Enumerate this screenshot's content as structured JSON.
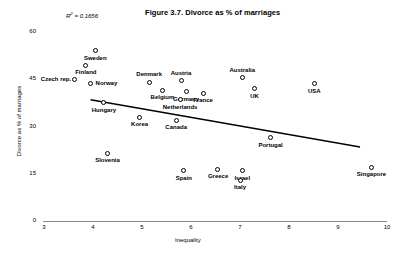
{
  "chart_data": {
    "type": "scatter",
    "title": "Figure 3.7. Divorce as % of marriages",
    "xlabel": "Inequality",
    "ylabel": "Divorce as % of marriages",
    "r2_prefix": "R",
    "r2_sup": "2",
    "r2_text": " = 0.1656",
    "r2_value": 0.1656,
    "xlim": [
      3,
      10
    ],
    "ylim": [
      0,
      60
    ],
    "xticks": [
      "3",
      "4",
      "5",
      "6",
      "7",
      "8",
      "9",
      "10"
    ],
    "yticks": [
      "60",
      "45",
      "30",
      "15",
      "0"
    ],
    "grid": false,
    "legend": "none",
    "marker_style": "open-circle",
    "trendline": {
      "visible": true,
      "x_start": 3.95,
      "y_start": 38.5,
      "x_end": 9.45,
      "y_end": 23.5,
      "slope": -2.73,
      "intercept": 49.3
    },
    "points": [
      {
        "label": "Sweden",
        "x": 4.05,
        "y": 54.0,
        "label_pos": "below"
      },
      {
        "label": "Finland",
        "x": 3.85,
        "y": 49.5,
        "label_pos": "below"
      },
      {
        "label": "Czech rep.",
        "x": 3.63,
        "y": 45.0,
        "label_pos": "left"
      },
      {
        "label": "Norway",
        "x": 3.95,
        "y": 43.5,
        "label_pos": "right"
      },
      {
        "label": "Denmark",
        "x": 5.15,
        "y": 44.0,
        "label_pos": "above"
      },
      {
        "label": "Austria",
        "x": 5.8,
        "y": 44.5,
        "label_pos": "above"
      },
      {
        "label": "Belgium",
        "x": 5.42,
        "y": 41.5,
        "label_pos": "below"
      },
      {
        "label": "Germany",
        "x": 5.9,
        "y": 41.0,
        "label_pos": "below"
      },
      {
        "label": "France",
        "x": 6.25,
        "y": 40.5,
        "label_pos": "below"
      },
      {
        "label": "Netherlands",
        "x": 5.78,
        "y": 38.5,
        "label_pos": "below"
      },
      {
        "label": "Hungary",
        "x": 4.22,
        "y": 37.5,
        "label_pos": "below"
      },
      {
        "label": "Korea",
        "x": 4.95,
        "y": 33.0,
        "label_pos": "below"
      },
      {
        "label": "Canada",
        "x": 5.7,
        "y": 32.0,
        "label_pos": "below"
      },
      {
        "label": "Australia",
        "x": 7.05,
        "y": 45.5,
        "label_pos": "above"
      },
      {
        "label": "UK",
        "x": 7.3,
        "y": 42.0,
        "label_pos": "below"
      },
      {
        "label": "USA",
        "x": 8.52,
        "y": 43.5,
        "label_pos": "below"
      },
      {
        "label": "Slovenia",
        "x": 4.3,
        "y": 21.5,
        "label_pos": "below"
      },
      {
        "label": "Spain",
        "x": 5.85,
        "y": 16.0,
        "label_pos": "below"
      },
      {
        "label": "Greece",
        "x": 6.55,
        "y": 16.5,
        "label_pos": "below"
      },
      {
        "label": "Israel",
        "x": 7.05,
        "y": 16.0,
        "label_pos": "below"
      },
      {
        "label": "Italy",
        "x": 7.0,
        "y": 13.0,
        "label_pos": "below"
      },
      {
        "label": "Portugal",
        "x": 7.62,
        "y": 26.5,
        "label_pos": "below"
      },
      {
        "label": "Singapore",
        "x": 9.68,
        "y": 17.0,
        "label_pos": "below"
      }
    ]
  }
}
